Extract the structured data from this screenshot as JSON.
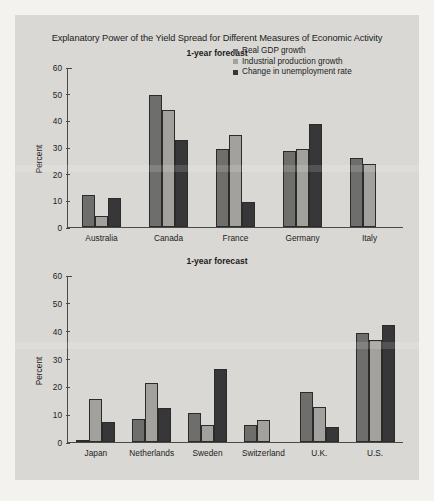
{
  "figure": {
    "title": "Explanatory Power of the Yield Spread for Different Measures of Economic Activity",
    "ylabel": "Percent"
  },
  "legend": {
    "items": [
      {
        "label": "Real GDP growth",
        "color": "#6e6e6c"
      },
      {
        "label": "Industrial production growth",
        "color": "#a2a19d"
      },
      {
        "label": "Change in unemployment rate",
        "color": "#37373a"
      }
    ]
  },
  "chart_data": [
    {
      "type": "bar",
      "title": "1-year forecast",
      "xlabel": "",
      "ylabel": "Percent",
      "ylim": [
        0,
        60
      ],
      "yticks": [
        0,
        10,
        20,
        30,
        40,
        50,
        60
      ],
      "grid": false,
      "legend_position": "top-right",
      "categories": [
        "Australia",
        "Canada",
        "France",
        "Germany",
        "Italy"
      ],
      "series": [
        {
          "name": "Real GDP growth",
          "values": [
            12.2,
            50.0,
            29.5,
            28.8,
            26.2
          ]
        },
        {
          "name": "Industrial production growth",
          "values": [
            4.1,
            44.0,
            34.6,
            29.5,
            23.9
          ]
        },
        {
          "name": "Change in unemployment rate",
          "values": [
            11.1,
            32.8,
            9.6,
            38.8,
            null
          ]
        }
      ]
    },
    {
      "type": "bar",
      "title": "1-year forecast",
      "xlabel": "",
      "ylabel": "Percent",
      "ylim": [
        0,
        60
      ],
      "yticks": [
        0,
        10,
        20,
        30,
        40,
        50,
        60
      ],
      "grid": false,
      "legend_position": "none",
      "categories": [
        "Japan",
        "Netherlands",
        "Sweden",
        "Switzerland",
        "U.K.",
        "U.S."
      ],
      "series": [
        {
          "name": "Real GDP growth",
          "values": [
            0.6,
            8.4,
            10.4,
            6.1,
            18.0,
            39.3
          ]
        },
        {
          "name": "Industrial production growth",
          "values": [
            15.6,
            21.5,
            6.2,
            7.8,
            12.8,
            36.9
          ]
        },
        {
          "name": "Change in unemployment rate",
          "values": [
            7.3,
            12.2,
            26.4,
            null,
            5.5,
            42.2
          ]
        }
      ]
    }
  ]
}
